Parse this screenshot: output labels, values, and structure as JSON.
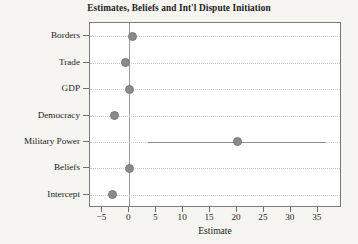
{
  "chart_data": {
    "type": "scatter",
    "title": "Estimates, Beliefs and Int'l Dispute Initiation",
    "xlabel": "Estimate",
    "ylabel": "",
    "orientation": "horizontal",
    "grid": true,
    "legend": null,
    "xlim": [
      -7.3,
      39.5
    ],
    "xticks": [
      -5,
      0,
      5,
      10,
      15,
      20,
      25,
      30,
      35
    ],
    "xtick_labels": [
      "−5",
      "0",
      "5",
      "10",
      "15",
      "20",
      "25",
      "30",
      "35"
    ],
    "zero_reference_line": 0,
    "categories": [
      "Borders",
      "Trade",
      "GDP",
      "Democracy",
      "Military Power",
      "Beliefs",
      "Intercept"
    ],
    "values": [
      0.6,
      -0.7,
      0.0,
      -2.7,
      20.0,
      0.0,
      -3.2
    ],
    "error_bars": [
      {
        "category": "Borders",
        "low": 0.6,
        "high": 0.6
      },
      {
        "category": "Trade",
        "low": -0.7,
        "high": -0.7
      },
      {
        "category": "GDP",
        "low": 0.0,
        "high": 0.0
      },
      {
        "category": "Democracy",
        "low": -2.7,
        "high": -2.7
      },
      {
        "category": "Military Power",
        "low": 3.4,
        "high": 36.5
      },
      {
        "category": "Beliefs",
        "low": 0.0,
        "high": 0.0
      },
      {
        "category": "Intercept",
        "low": -3.2,
        "high": -3.2
      }
    ],
    "series": [
      {
        "name": "Estimate",
        "points": [
          {
            "label": "Borders",
            "value": 0.6,
            "ci_low": 0.6,
            "ci_high": 0.6
          },
          {
            "label": "Trade",
            "value": -0.7,
            "ci_low": -0.7,
            "ci_high": -0.7
          },
          {
            "label": "GDP",
            "value": 0.0,
            "ci_low": 0.0,
            "ci_high": 0.0
          },
          {
            "label": "Democracy",
            "value": -2.7,
            "ci_low": -2.7,
            "ci_high": -2.7
          },
          {
            "label": "Military Power",
            "value": 20.0,
            "ci_low": 3.4,
            "ci_high": 36.5
          },
          {
            "label": "Beliefs",
            "value": 0.0,
            "ci_low": 0.0,
            "ci_high": 0.0
          },
          {
            "label": "Intercept",
            "value": -3.2,
            "ci_low": -3.2,
            "ci_high": -3.2
          }
        ]
      }
    ],
    "colors": {
      "marker": "#8a8a8a",
      "ci_line": "#8d8d8d",
      "zero_line": "#9a9a9a",
      "grid": "#c9c9c9",
      "frame": "#7b7b7b",
      "plot_background": "#ffffff",
      "figure_background": "#f7f5f2",
      "text": "#232323"
    }
  }
}
